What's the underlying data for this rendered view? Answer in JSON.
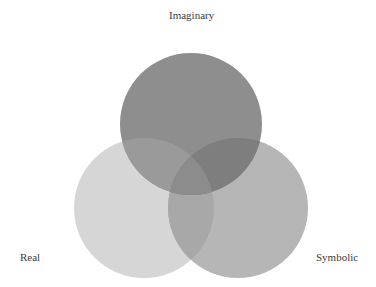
{
  "diagram": {
    "type": "venn",
    "sets": [
      {
        "id": "imaginary",
        "label": "Imaginary",
        "cx": 191,
        "cy": 124,
        "r": 71,
        "fill": "#8e8e8e"
      },
      {
        "id": "real",
        "label": "Real",
        "cx": 144,
        "cy": 208,
        "r": 70,
        "fill": "#d6d6d6"
      },
      {
        "id": "symbolic",
        "label": "Symbolic",
        "cx": 238,
        "cy": 208,
        "r": 70,
        "fill": "#b6b6b6"
      }
    ],
    "overlap_colors": {
      "imaginary_real": "#9a9a9a",
      "imaginary_symbolic": "#7e7e7e",
      "real_symbolic": "#a8a8a8"
    }
  },
  "labels": {
    "imaginary": "Imaginary",
    "real": "Real",
    "symbolic": "Symbolic"
  }
}
